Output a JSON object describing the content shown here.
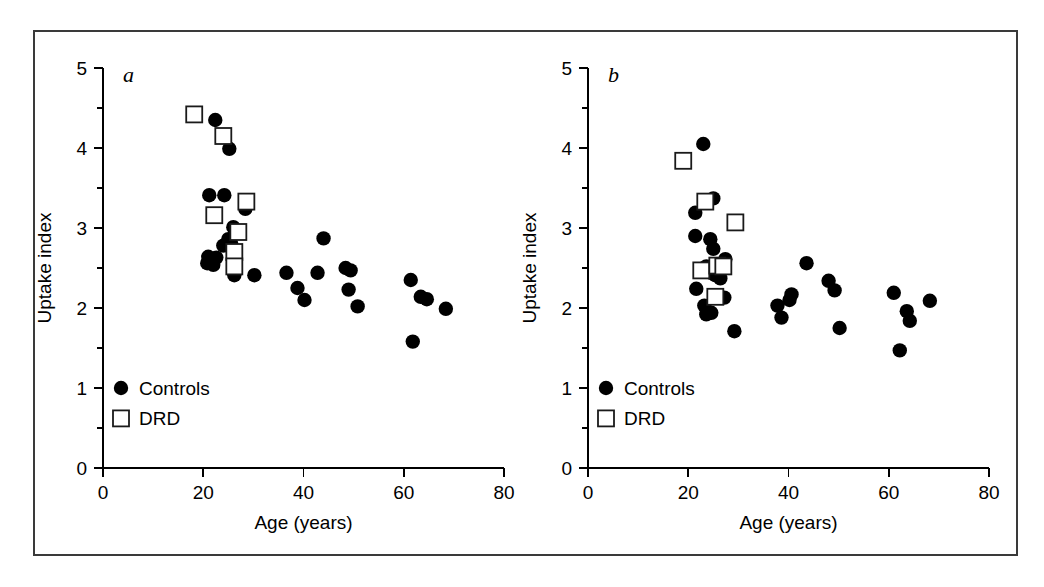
{
  "figure": {
    "background_color": "#ffffff",
    "frame_color": "#3a3a3a",
    "marker_control_color": "#000000",
    "marker_drd_fill": "#ffffff",
    "marker_drd_stroke": "#1a1a1a"
  },
  "chart_data": [
    {
      "type": "scatter",
      "panel": "a",
      "panel_letter": "a",
      "title": "",
      "xlabel": "Age (years)",
      "ylabel": "Uptake index",
      "xlim": [
        0,
        80
      ],
      "ylim": [
        0,
        5
      ],
      "xticks": [
        0,
        20,
        40,
        60,
        80
      ],
      "yticks": [
        0,
        1,
        2,
        3,
        4,
        5
      ],
      "yticks_minor": [
        0.5,
        1.5,
        2.5,
        3.5,
        4.5
      ],
      "grid": false,
      "legend_position": "lower-left",
      "series": [
        {
          "name": "Controls",
          "marker": "filled-circle",
          "color": "#000000",
          "points": [
            [
              22.4,
              4.35
            ],
            [
              25.2,
              3.99
            ],
            [
              21.2,
              3.41
            ],
            [
              24.2,
              3.41
            ],
            [
              28.4,
              3.24
            ],
            [
              26.0,
              3.01
            ],
            [
              25.0,
              2.86
            ],
            [
              25.6,
              2.8
            ],
            [
              24.0,
              2.78
            ],
            [
              21.0,
              2.64
            ],
            [
              22.6,
              2.63
            ],
            [
              20.8,
              2.56
            ],
            [
              22.0,
              2.54
            ],
            [
              26.2,
              2.41
            ],
            [
              30.2,
              2.41
            ],
            [
              36.6,
              2.44
            ],
            [
              38.8,
              2.25
            ],
            [
              40.2,
              2.1
            ],
            [
              44.0,
              2.87
            ],
            [
              42.8,
              2.44
            ],
            [
              48.4,
              2.5
            ],
            [
              49.4,
              2.47
            ],
            [
              49.0,
              2.23
            ],
            [
              50.8,
              2.02
            ],
            [
              61.4,
              2.35
            ],
            [
              63.4,
              2.14
            ],
            [
              64.6,
              2.11
            ],
            [
              68.4,
              1.99
            ],
            [
              61.8,
              1.58
            ]
          ]
        },
        {
          "name": "DRD",
          "marker": "open-square",
          "color": "#ffffff",
          "points": [
            [
              18.2,
              4.42
            ],
            [
              24.0,
              4.15
            ],
            [
              28.6,
              3.33
            ],
            [
              22.2,
              3.16
            ],
            [
              27.0,
              2.95
            ],
            [
              26.2,
              2.7
            ],
            [
              26.2,
              2.52
            ]
          ]
        }
      ]
    },
    {
      "type": "scatter",
      "panel": "b",
      "panel_letter": "b",
      "title": "",
      "xlabel": "Age (years)",
      "ylabel": "Uptake index",
      "xlim": [
        0,
        80
      ],
      "ylim": [
        0,
        5
      ],
      "xticks": [
        0,
        20,
        40,
        60,
        80
      ],
      "yticks": [
        0,
        1,
        2,
        3,
        4,
        5
      ],
      "yticks_minor": [
        0.5,
        1.5,
        2.5,
        3.5,
        4.5
      ],
      "grid": false,
      "legend_position": "lower-left",
      "series": [
        {
          "name": "Controls",
          "marker": "filled-circle",
          "color": "#000000",
          "points": [
            [
              23.0,
              4.05
            ],
            [
              25.0,
              3.37
            ],
            [
              21.4,
              3.19
            ],
            [
              21.4,
              2.9
            ],
            [
              24.4,
              2.86
            ],
            [
              25.0,
              2.74
            ],
            [
              27.4,
              2.61
            ],
            [
              23.6,
              2.52
            ],
            [
              24.6,
              2.44
            ],
            [
              25.4,
              2.41
            ],
            [
              26.4,
              2.37
            ],
            [
              21.6,
              2.24
            ],
            [
              25.8,
              2.16
            ],
            [
              27.2,
              2.13
            ],
            [
              23.2,
              2.03
            ],
            [
              23.6,
              1.92
            ],
            [
              24.6,
              1.94
            ],
            [
              29.2,
              1.71
            ],
            [
              37.8,
              2.03
            ],
            [
              38.6,
              1.88
            ],
            [
              40.2,
              2.1
            ],
            [
              40.6,
              2.17
            ],
            [
              43.6,
              2.56
            ],
            [
              48.0,
              2.34
            ],
            [
              49.2,
              2.22
            ],
            [
              50.2,
              1.75
            ],
            [
              61.0,
              2.19
            ],
            [
              63.6,
              1.96
            ],
            [
              64.2,
              1.84
            ],
            [
              68.2,
              2.09
            ],
            [
              62.2,
              1.47
            ]
          ]
        },
        {
          "name": "DRD",
          "marker": "open-square",
          "color": "#ffffff",
          "points": [
            [
              19.0,
              3.84
            ],
            [
              23.4,
              3.33
            ],
            [
              29.4,
              3.07
            ],
            [
              22.6,
              2.47
            ],
            [
              25.8,
              2.53
            ],
            [
              27.0,
              2.52
            ],
            [
              25.4,
              2.14
            ]
          ]
        }
      ]
    }
  ],
  "labels": {
    "x_axis_title": "Age (years)",
    "y_axis_title": "Uptake index",
    "legend_controls": "Controls",
    "legend_drd": "DRD",
    "panel_a_letter": "a",
    "panel_b_letter": "b",
    "xtick_0": "0",
    "xtick_20": "20",
    "xtick_40": "40",
    "xtick_60": "60",
    "xtick_80": "80",
    "ytick_0": "0",
    "ytick_1": "1",
    "ytick_2": "2",
    "ytick_3": "3",
    "ytick_4": "4",
    "ytick_5": "5"
  }
}
